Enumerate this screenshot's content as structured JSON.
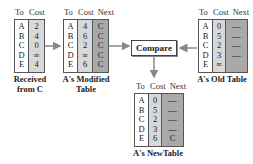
{
  "diagram": {
    "column_headers": {
      "to": "To",
      "cost": "Cost",
      "next": "Next"
    },
    "received_from_c": {
      "caption_line1": "Received",
      "caption_line2": "from C",
      "rows": [
        {
          "to": "A",
          "cost": "2"
        },
        {
          "to": "B",
          "cost": "4"
        },
        {
          "to": "C",
          "cost": "0"
        },
        {
          "to": "D",
          "cost": "∞"
        },
        {
          "to": "E",
          "cost": "4"
        }
      ]
    },
    "modified_table": {
      "caption_line1": "A's Modified",
      "caption_line2": "Table",
      "rows": [
        {
          "to": "A",
          "cost": "4",
          "next": "C"
        },
        {
          "to": "B",
          "cost": "6",
          "next": "C"
        },
        {
          "to": "C",
          "cost": "2",
          "next": "C"
        },
        {
          "to": "D",
          "cost": "∞",
          "next": "C"
        },
        {
          "to": "E",
          "cost": "6",
          "next": "C"
        }
      ]
    },
    "compare_label": "Compare",
    "old_table": {
      "caption": "A's Old Table",
      "rows": [
        {
          "to": "A",
          "cost": "0",
          "next": "—"
        },
        {
          "to": "B",
          "cost": "5",
          "next": "—"
        },
        {
          "to": "C",
          "cost": "2",
          "next": "—"
        },
        {
          "to": "D",
          "cost": "3",
          "next": "—"
        },
        {
          "to": "E",
          "cost": "∞",
          "next": ""
        }
      ]
    },
    "new_table": {
      "caption": "A's NewTable",
      "rows": [
        {
          "to": "A",
          "cost": "0",
          "next": "—"
        },
        {
          "to": "B",
          "cost": "5",
          "next": "—"
        },
        {
          "to": "C",
          "cost": "2",
          "next": "—"
        },
        {
          "to": "D",
          "cost": "3",
          "next": "—"
        },
        {
          "to": "E",
          "cost": "6",
          "next": "C"
        }
      ]
    },
    "colors": {
      "to_col": "#ffffff",
      "cost_col": "#d8d8d8",
      "next_col": "#a9a9a9",
      "arrow": "#888888"
    }
  }
}
